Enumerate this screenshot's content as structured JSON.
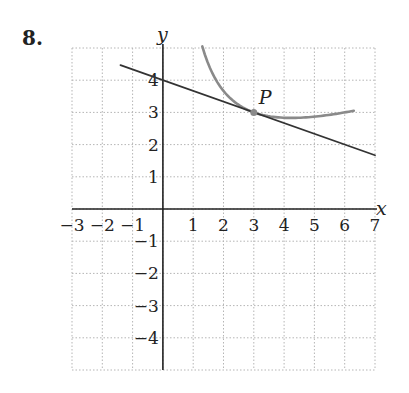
{
  "problem": {
    "number": "8."
  },
  "chart_data": {
    "type": "line",
    "title": "",
    "xlabel": "x",
    "ylabel": "y",
    "xlim": [
      -3,
      7
    ],
    "ylim": [
      -5,
      5
    ],
    "grid": true,
    "x_ticks": [
      "-3",
      "-2",
      "-1",
      "1",
      "2",
      "3",
      "4",
      "5",
      "6",
      "7"
    ],
    "y_ticks": [
      "4",
      "3",
      "2",
      "1",
      "-1",
      "-2",
      "-3",
      "-4"
    ],
    "series": [
      {
        "name": "curve",
        "color": "#8a8a8a",
        "description": "y = 6/x + x/3",
        "x": [
          1.3,
          1.5,
          2,
          2.5,
          3,
          3.5,
          4,
          4.5,
          5,
          5.5,
          6,
          6.3
        ],
        "y": [
          5.05,
          4.5,
          3.67,
          3.23,
          3.0,
          2.88,
          2.83,
          2.83,
          2.87,
          2.92,
          3.0,
          3.05
        ]
      },
      {
        "name": "tangent line",
        "color": "#333333",
        "description": "y = -x/3 + 4",
        "x": [
          -1.4,
          7
        ],
        "y": [
          4.47,
          1.67
        ]
      }
    ],
    "annotations": [
      {
        "label": "P",
        "x": 3,
        "y": 3
      }
    ]
  }
}
